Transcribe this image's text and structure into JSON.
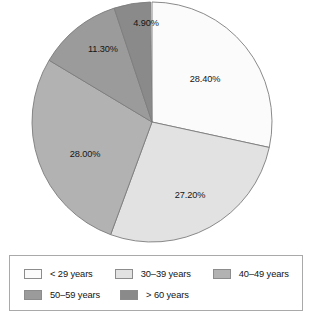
{
  "chart_data": {
    "type": "pie",
    "title": "",
    "subtitle": "",
    "xlabel": "",
    "ylabel": "",
    "grid": false,
    "legend_position": "bottom",
    "start_angle_deg": 0,
    "direction": "clockwise",
    "center": {
      "x": 152,
      "y": 122
    },
    "radius": 120,
    "categories": [
      "< 29 years",
      "30–39 years",
      "40–49 years",
      "50–59 years",
      "> 60 years"
    ],
    "values": [
      28.4,
      27.2,
      28.0,
      11.3,
      4.9
    ],
    "value_labels": [
      "28.40%",
      "27.20%",
      "28.00%",
      "11.30%",
      "4.90%"
    ],
    "colors": [
      "#fbfbfb",
      "#e2e2e2",
      "#b2b2b2",
      "#9b9b9b",
      "#8a8a8a"
    ],
    "slice_border_color": "#7d7d7d",
    "slices": [
      {
        "label": "< 29 years",
        "value": 28.4,
        "value_label": "28.40%",
        "color": "#fbfbfb",
        "start_deg": 0.0,
        "end_deg": 102.24,
        "label_x": 205,
        "label_y": 80
      },
      {
        "label": "30–39 years",
        "value": 27.2,
        "value_label": "27.20%",
        "color": "#e2e2e2",
        "start_deg": 102.24,
        "end_deg": 200.16,
        "label_x": 190,
        "label_y": 196
      },
      {
        "label": "40–49 years",
        "value": 28.0,
        "value_label": "28.00%",
        "color": "#b2b2b2",
        "start_deg": 200.16,
        "end_deg": 300.96,
        "label_x": 85,
        "label_y": 155
      },
      {
        "label": "50–59 years",
        "value": 11.3,
        "value_label": "11.30%",
        "color": "#9b9b9b",
        "start_deg": 300.96,
        "end_deg": 341.64,
        "label_x": 103,
        "label_y": 50
      },
      {
        "label": "> 60 years",
        "value": 4.9,
        "value_label": "4.90%",
        "color": "#8a8a8a",
        "start_deg": 341.64,
        "end_deg": 359.28,
        "label_x": 146,
        "label_y": 24
      }
    ]
  },
  "legend": {
    "rows": [
      [
        {
          "label": "< 29 years",
          "color": "#fbfbfb"
        },
        {
          "label": "30–39 years",
          "color": "#e2e2e2"
        },
        {
          "label": "40–49 years",
          "color": "#b2b2b2"
        }
      ],
      [
        {
          "label": "50–59 years",
          "color": "#9b9b9b"
        },
        {
          "label": "> 60 years",
          "color": "#8a8a8a"
        }
      ]
    ]
  }
}
